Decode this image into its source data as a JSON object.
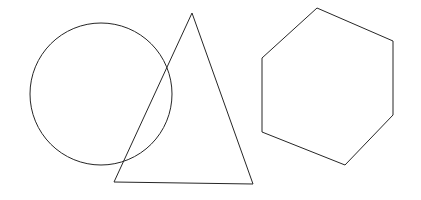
{
  "canvas": {
    "width": 421,
    "height": 200,
    "background_color": "#ffffff",
    "stroke_color": "#262626",
    "stroke_width": 1,
    "fill": "none",
    "description": "Line drawing of three overlapping outlined geometric shapes on a plain white background"
  },
  "shapes": [
    {
      "id": "circle",
      "name": "circle",
      "label": "Circle",
      "type": "circle",
      "cx": 101,
      "cy": 94,
      "r": 71,
      "bounds": {
        "left": 30,
        "top": 23,
        "right": 172,
        "bottom": 165
      },
      "stroke_color": "#262626",
      "fill": "none"
    },
    {
      "id": "triangle",
      "name": "triangle",
      "label": "Triangle",
      "type": "polygon",
      "sides": 3,
      "points": "192,13 253,184 114,182",
      "vertices": [
        {
          "x": 192,
          "y": 13
        },
        {
          "x": 253,
          "y": 184
        },
        {
          "x": 114,
          "y": 182
        }
      ],
      "bounds": {
        "left": 114,
        "top": 13,
        "right": 253,
        "bottom": 184
      },
      "stroke_color": "#262626",
      "fill": "none"
    },
    {
      "id": "hexagon",
      "name": "hexagon",
      "label": "Hexagon",
      "type": "polygon",
      "sides": 6,
      "points": "317,8 393,41 393,115 345,165 262,132 262,58",
      "vertices": [
        {
          "x": 317,
          "y": 8
        },
        {
          "x": 393,
          "y": 41
        },
        {
          "x": 393,
          "y": 115
        },
        {
          "x": 345,
          "y": 165
        },
        {
          "x": 262,
          "y": 132
        },
        {
          "x": 262,
          "y": 58
        }
      ],
      "bounds": {
        "left": 262,
        "top": 8,
        "right": 393,
        "bottom": 165
      },
      "stroke_color": "#262626",
      "fill": "none"
    }
  ]
}
